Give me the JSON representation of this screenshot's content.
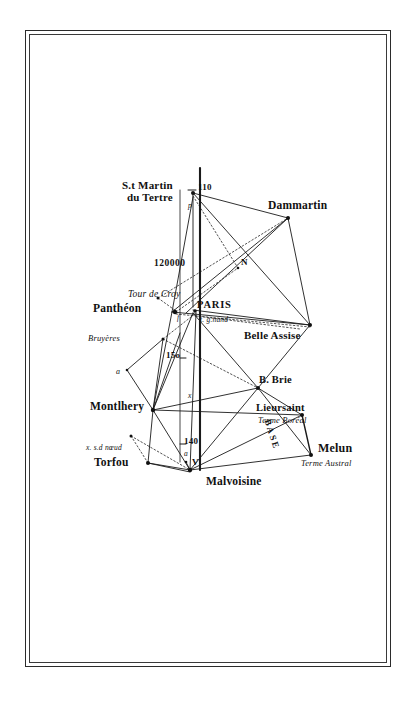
{
  "plate": {
    "title": "Carte de la triangulation de la méridienne de Paris",
    "ink_color": "#1a1a1a",
    "paper_color": "#ffffff"
  },
  "scale": {
    "denominator": "120000",
    "label": "120000"
  },
  "meridian": {
    "name": "Paris meridian",
    "latitude_marks": [
      "110",
      "150",
      "140"
    ]
  },
  "graduations": [
    {
      "id": "grad-110",
      "label": "110",
      "x": 196,
      "y": 190
    },
    {
      "id": "grad-150",
      "label": "15o",
      "x": 168,
      "y": 355
    },
    {
      "id": "grad-140",
      "label": "140",
      "x": 186,
      "y": 442
    }
  ],
  "stations": [
    {
      "id": "st-martin-du-tertre",
      "label_line1": "S.t Martin",
      "label_line2": "du Tertre",
      "x": 189,
      "y": 193,
      "style": "roman"
    },
    {
      "id": "dammartin",
      "label": "Dammartin",
      "x": 274,
      "y": 207,
      "style": "roman"
    },
    {
      "id": "belle-assise",
      "label": "Belle Assise",
      "x": 262,
      "y": 336,
      "style": "roman"
    },
    {
      "id": "brie",
      "label": "B. Brie",
      "x": 258,
      "y": 381,
      "style": "roman"
    },
    {
      "id": "lieursaint",
      "label": "Lieursaint",
      "x": 299,
      "y": 408,
      "style": "roman"
    },
    {
      "id": "terme-boreal",
      "label": "Terme Boréal",
      "x": 299,
      "y": 420,
      "style": "ital"
    },
    {
      "id": "melun",
      "label": "Melun",
      "x": 334,
      "y": 449,
      "style": "roman"
    },
    {
      "id": "terme-austral",
      "label": "Terme Austral",
      "x": 316,
      "y": 465,
      "style": "ital"
    },
    {
      "id": "malvoisine",
      "label": "Malvoisine",
      "x": 213,
      "y": 481,
      "style": "roman"
    },
    {
      "id": "torfou",
      "label": "Torfou",
      "x": 113,
      "y": 463,
      "style": "roman"
    },
    {
      "id": "montlhery",
      "label": "Montlhery",
      "x": 97,
      "y": 404,
      "style": "roman"
    },
    {
      "id": "pantheon",
      "label": "Panthéon",
      "x": 113,
      "y": 306,
      "style": "roman"
    },
    {
      "id": "paris",
      "label": "PARIS",
      "x": 197,
      "y": 301,
      "style": "roman"
    },
    {
      "id": "invalides",
      "label": "Invalides",
      "x": 130,
      "y": 292,
      "style": "ital"
    },
    {
      "id": "tour-de-croy",
      "label": "Tour de Croy",
      "x": 92,
      "y": 338,
      "style": "ital"
    },
    {
      "id": "bruyeres",
      "label": "Bruyères",
      "x": 92,
      "y": 430,
      "style": "ital"
    },
    {
      "id": "t-grenand",
      "label": "t. g.nand",
      "x": 200,
      "y": 317,
      "style": "ital"
    }
  ],
  "annotations": [
    {
      "id": "second-noeud",
      "label": "x. s.d nœud",
      "x": 90,
      "y": 447
    },
    {
      "id": "base-label",
      "label": "BASE",
      "x": 276,
      "y": 428
    },
    {
      "id": "node-n",
      "label": "N",
      "x": 243,
      "y": 262
    },
    {
      "id": "node-p",
      "label": "p",
      "x": 190,
      "y": 208
    },
    {
      "id": "node-f",
      "label": "f",
      "x": 180,
      "y": 315
    },
    {
      "id": "node-a-croy",
      "label": "a",
      "x": 118,
      "y": 372
    },
    {
      "id": "node-x-montlhery",
      "label": "x",
      "x": 189,
      "y": 398
    },
    {
      "id": "node-a-malvoisine",
      "label": "a",
      "x": 186,
      "y": 455
    },
    {
      "id": "node-v",
      "label": "V",
      "x": 196,
      "y": 465
    }
  ],
  "legend": {
    "solid_lines": "triangulation sides",
    "dotted_lines": "secondary / auxiliary rays"
  }
}
